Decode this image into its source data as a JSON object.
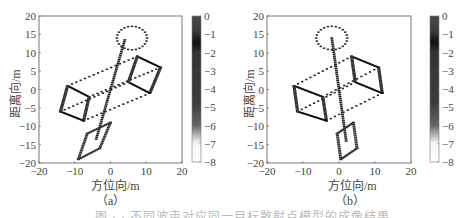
{
  "figure": {
    "caption": "图 · · 不同波束对应同一目标散射点模型的成像结果"
  },
  "chart_data": [
    {
      "type": "scatter",
      "panel_label": "（a）",
      "title": "",
      "xlabel": "方位向/m",
      "ylabel": "距离向/m",
      "xlim": [
        -20,
        20
      ],
      "ylim": [
        -20,
        20
      ],
      "xticks": [
        "−20",
        "−10",
        "0",
        "10",
        "20"
      ],
      "yticks": [
        "20",
        "15",
        "10",
        "5",
        "0",
        "−5",
        "−10",
        "−15",
        "−20"
      ],
      "grid": false,
      "colorbar": {
        "range": [
          -8,
          0
        ],
        "ticks": [
          "0",
          "−1",
          "−2",
          "−3",
          "−4",
          "−5",
          "−6",
          "−7",
          "−8"
        ],
        "colormap": "gray"
      },
      "description": "Point-scatter target model (ellipse on top, rotated line spine, two wire-frame boxes linked by dashed lines, lower parallelogram) rotated clockwise",
      "shapes": {
        "ellipse": {
          "cx": 6,
          "cy": 14,
          "rx": 4.2,
          "ry": 3.2
        },
        "spine": [
          [
            4,
            13.5
          ],
          [
            -4,
            -13.5
          ]
        ],
        "left_box": [
          [
            -12,
            1
          ],
          [
            -6,
            -2
          ],
          [
            -7.5,
            -8.5
          ],
          [
            -14,
            -6
          ]
        ],
        "right_box": [
          [
            7.5,
            9
          ],
          [
            14,
            6
          ],
          [
            11,
            -1
          ],
          [
            5,
            2
          ]
        ],
        "links": [
          [
            [
              -12,
              1
            ],
            [
              7.5,
              9
            ]
          ],
          [
            [
              -6,
              -2
            ],
            [
              14,
              6
            ]
          ],
          [
            [
              -7.5,
              -8.5
            ],
            [
              11,
              -1
            ]
          ],
          [
            [
              -14,
              -6
            ],
            [
              5,
              2
            ]
          ]
        ],
        "lower_parallelogram": [
          [
            -9,
            -19
          ],
          [
            -3,
            -16
          ],
          [
            0,
            -9
          ],
          [
            -6.5,
            -12
          ]
        ]
      }
    },
    {
      "type": "scatter",
      "panel_label": "（b）",
      "title": "",
      "xlabel": "方位向/m",
      "ylabel": "距离向/m",
      "xlim": [
        -20,
        20
      ],
      "ylim": [
        -20,
        20
      ],
      "xticks": [
        "−20",
        "−10",
        "0",
        "10",
        "20"
      ],
      "yticks": [
        "20",
        "15",
        "10",
        "5",
        "0",
        "−5",
        "−10",
        "−15",
        "−20"
      ],
      "grid": false,
      "colorbar": {
        "range": [
          -8,
          0
        ],
        "ticks": [
          "0",
          "−1",
          "−2",
          "−3",
          "−4",
          "−5",
          "−6",
          "−7",
          "−8"
        ],
        "colormap": "gray"
      },
      "description": "Same point-scatter target model with a smaller rotation",
      "shapes": {
        "ellipse": {
          "cx": -2,
          "cy": 14,
          "rx": 4.3,
          "ry": 3.2
        },
        "spine": [
          [
            -2,
            14
          ],
          [
            2,
            -14
          ]
        ],
        "left_box": [
          [
            -12.5,
            1
          ],
          [
            -4.5,
            -2
          ],
          [
            -3.5,
            -8.5
          ],
          [
            -11.5,
            -6
          ]
        ],
        "right_box": [
          [
            3.5,
            9
          ],
          [
            11,
            6
          ],
          [
            12,
            -1
          ],
          [
            4.5,
            2
          ]
        ],
        "links": [
          [
            [
              -12.5,
              1
            ],
            [
              3.5,
              9
            ]
          ],
          [
            [
              -4.5,
              -2
            ],
            [
              11,
              6
            ]
          ],
          [
            [
              -3.5,
              -8.5
            ],
            [
              12,
              -1
            ]
          ],
          [
            [
              -11.5,
              -6
            ],
            [
              4.5,
              2
            ]
          ]
        ],
        "lower_parallelogram": [
          [
            0.5,
            -19
          ],
          [
            5,
            -16
          ],
          [
            4,
            -9
          ],
          [
            -0.5,
            -12
          ]
        ]
      }
    }
  ]
}
